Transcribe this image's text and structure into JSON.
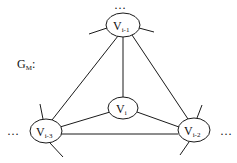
{
  "graph": {
    "label": "G",
    "label_sub": "M",
    "label_suffix": ":",
    "nodes": {
      "top": {
        "base": "V",
        "sub": "i-1"
      },
      "center": {
        "base": "V",
        "sub": "i"
      },
      "left": {
        "base": "V",
        "sub": "i-3"
      },
      "right": {
        "base": "V",
        "sub": "i-2"
      }
    },
    "ellipsis": {
      "top": "…",
      "left": "…",
      "right": "…"
    }
  }
}
